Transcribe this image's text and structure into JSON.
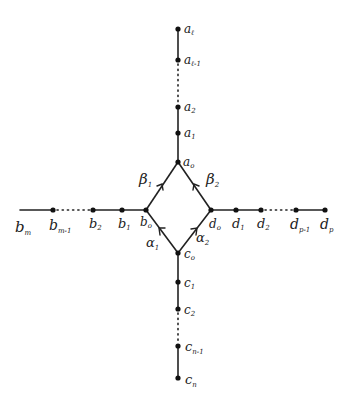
{
  "diagram": {
    "type": "quiver",
    "arms": {
      "top": {
        "nodes": [
          {
            "id": "a0",
            "base": "a",
            "sub": "0",
            "x": 178,
            "y": 162
          },
          {
            "id": "a1",
            "base": "a",
            "sub": "1",
            "x": 178,
            "y": 133
          },
          {
            "id": "a2",
            "base": "a",
            "sub": "2",
            "x": 178,
            "y": 107
          },
          {
            "id": "a_l-1",
            "base": "a",
            "sub": "ℓ-1",
            "x": 178,
            "y": 60
          },
          {
            "id": "a_l",
            "base": "a",
            "sub": "ℓ",
            "x": 178,
            "y": 29
          }
        ],
        "dotted_between": [
          "a2",
          "a_l-1"
        ]
      },
      "left": {
        "nodes": [
          {
            "id": "b0",
            "base": "b",
            "sub": "0",
            "x": 146,
            "y": 210
          },
          {
            "id": "b1",
            "base": "b",
            "sub": "1",
            "x": 122,
            "y": 210
          },
          {
            "id": "b2",
            "base": "b",
            "sub": "2",
            "x": 93,
            "y": 210
          },
          {
            "id": "b_m-1",
            "base": "b",
            "sub": "m-1",
            "x": 53,
            "y": 210
          },
          {
            "id": "b_m",
            "base": "b",
            "sub": "m",
            "x": 20,
            "y": 210
          }
        ],
        "dotted_between": [
          "b_m-1",
          "b2"
        ]
      },
      "right": {
        "nodes": [
          {
            "id": "d0",
            "base": "d",
            "sub": "0",
            "x": 211,
            "y": 210
          },
          {
            "id": "d1",
            "base": "d",
            "sub": "1",
            "x": 236,
            "y": 210
          },
          {
            "id": "d2",
            "base": "d",
            "sub": "2",
            "x": 261,
            "y": 210
          },
          {
            "id": "d_p-1",
            "base": "d",
            "sub": "p-1",
            "x": 296,
            "y": 210
          },
          {
            "id": "d_p",
            "base": "d",
            "sub": "p",
            "x": 325,
            "y": 210
          }
        ],
        "dotted_between": [
          "d2",
          "d_p-1"
        ]
      },
      "bottom": {
        "nodes": [
          {
            "id": "c0",
            "base": "c",
            "sub": "0",
            "x": 178,
            "y": 253
          },
          {
            "id": "c1",
            "base": "c",
            "sub": "1",
            "x": 178,
            "y": 282
          },
          {
            "id": "c2",
            "base": "c",
            "sub": "2",
            "x": 178,
            "y": 309
          },
          {
            "id": "c_n-1",
            "base": "c",
            "sub": "n-1",
            "x": 178,
            "y": 346
          },
          {
            "id": "c_n",
            "base": "c",
            "sub": "n",
            "x": 178,
            "y": 378
          }
        ],
        "dotted_between": [
          "c2",
          "c_n-1"
        ]
      }
    },
    "arrows": [
      {
        "name": "β",
        "sub": "1",
        "from": "b0",
        "to": "a0"
      },
      {
        "name": "β",
        "sub": "2",
        "from": "d0",
        "to": "a0"
      },
      {
        "name": "α",
        "sub": "1",
        "from": "c0",
        "to": "b0"
      },
      {
        "name": "α",
        "sub": "2",
        "from": "c0",
        "to": "d0"
      }
    ],
    "labels": {
      "a_l": "a",
      "a_l_sub": "ℓ",
      "a_lm1": "a",
      "a_lm1_sub": "ℓ-1",
      "a2": "a",
      "a2_sub": "2",
      "a1": "a",
      "a1_sub": "1",
      "a0": "a",
      "a0_sub": "o",
      "b_m": "b",
      "b_m_sub": "m",
      "b_mm1": "b",
      "b_mm1_sub": "m-1",
      "b2": "b",
      "b2_sub": "2",
      "b1": "b",
      "b1_sub": "1",
      "b0": "b",
      "b0_sub": "o",
      "d0": "d",
      "d0_sub": "o",
      "d1": "d",
      "d1_sub": "1",
      "d2": "d",
      "d2_sub": "2",
      "d_pm1": "d",
      "d_pm1_sub": "p-1",
      "d_p": "d",
      "d_p_sub": "p",
      "c0": "c",
      "c0_sub": "o",
      "c1": "c",
      "c1_sub": "1",
      "c2": "c",
      "c2_sub": "2",
      "c_nm1": "c",
      "c_nm1_sub": "n-1",
      "c_n": "c",
      "c_n_sub": "n",
      "beta1": "β",
      "beta1_sub": "1",
      "beta2": "β",
      "beta2_sub": "2",
      "alpha1": "α",
      "alpha1_sub": "1",
      "alpha2": "α",
      "alpha2_sub": "2"
    }
  }
}
